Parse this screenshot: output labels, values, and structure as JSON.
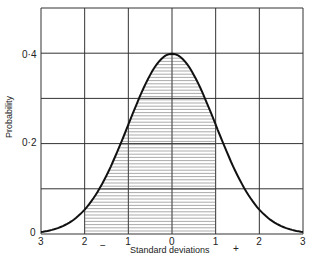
{
  "chart_data": {
    "type": "area",
    "title": "",
    "xlabel": "Standard deviations",
    "ylabel": "Probability",
    "x_ticks": [
      "3",
      "2",
      "1",
      "0",
      "1",
      "2",
      "3"
    ],
    "x_tick_values": [
      -3,
      -2,
      -1,
      0,
      1,
      2,
      3
    ],
    "y_ticks": [
      "0",
      "0·2",
      "0·4"
    ],
    "y_tick_values": [
      0,
      0.2,
      0.4
    ],
    "ylim": [
      0,
      0.5
    ],
    "xlim": [
      -3,
      3
    ],
    "grid": true,
    "sign_labels": {
      "negative": "−",
      "positive": "+"
    },
    "series": [
      {
        "name": "Normal distribution",
        "x": [
          -3,
          -2,
          -1,
          0,
          1,
          2,
          3
        ],
        "values": [
          0.004,
          0.054,
          0.242,
          0.399,
          0.242,
          0.054,
          0.004
        ]
      }
    ],
    "shaded_region": {
      "from": -2,
      "to": 1,
      "pattern": "horizontal-hatch"
    }
  }
}
